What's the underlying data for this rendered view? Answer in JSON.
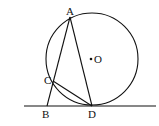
{
  "diagram": {
    "type": "geometry",
    "circle": {
      "center": [
        92,
        59
      ],
      "radius": 46,
      "label": "O"
    },
    "tangent_line": {
      "y": 106,
      "x1": 24,
      "x2": 156
    },
    "points": {
      "A": {
        "label": "A",
        "x": 70,
        "y": 17
      },
      "B": {
        "label": "B",
        "x": 47,
        "y": 106
      },
      "C": {
        "label": "C",
        "x": 53,
        "y": 81
      },
      "D": {
        "label": "D",
        "x": 92,
        "y": 106
      },
      "O": {
        "label": "O",
        "x": 92,
        "y": 59
      }
    },
    "segments": [
      "AB",
      "AD",
      "CD"
    ],
    "colors": {
      "stroke": "#111111",
      "background": "#ffffff"
    }
  }
}
